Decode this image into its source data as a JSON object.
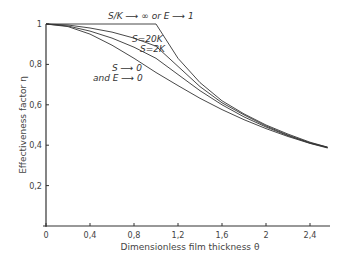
{
  "chart_data": {
    "type": "line",
    "title": "",
    "xlabel": "Dimensionless film thickness θ",
    "ylabel": "Effectiveness factor η",
    "xlim": [
      0,
      2.6
    ],
    "ylim": [
      0,
      1
    ],
    "x_ticks": [
      "0",
      "0,4",
      "0,8",
      "1,2",
      "1,6",
      "2",
      "2,4"
    ],
    "x_tick_values": [
      0,
      0.4,
      0.8,
      1.2,
      1.6,
      2.0,
      2.4
    ],
    "y_ticks": [
      "0,2",
      "0,4",
      "0,6",
      "0,8",
      "1"
    ],
    "y_tick_values": [
      0.2,
      0.4,
      0.6,
      0.8,
      1.0
    ],
    "grid": false,
    "legend": "inline annotations",
    "x": [
      0,
      0.2,
      0.4,
      0.6,
      0.8,
      1.0,
      1.2,
      1.4,
      1.6,
      1.8,
      2.0,
      2.2,
      2.4,
      2.56
    ],
    "series": [
      {
        "name": "S/K → ∞ or E → 1",
        "values": [
          1.0,
          1.0,
          1.0,
          1.0,
          1.0,
          1.0,
          0.83,
          0.71,
          0.62,
          0.555,
          0.5,
          0.455,
          0.415,
          0.39
        ]
      },
      {
        "name": "S = 20 K",
        "values": [
          1.0,
          0.995,
          0.98,
          0.96,
          0.93,
          0.89,
          0.79,
          0.69,
          0.61,
          0.55,
          0.495,
          0.45,
          0.412,
          0.39
        ]
      },
      {
        "name": "S = 2 K",
        "values": [
          1.0,
          0.99,
          0.965,
          0.93,
          0.885,
          0.83,
          0.75,
          0.67,
          0.6,
          0.54,
          0.49,
          0.447,
          0.41,
          0.388
        ]
      },
      {
        "name": "S → 0 and E → 0",
        "values": [
          1.0,
          0.987,
          0.95,
          0.895,
          0.83,
          0.76,
          0.695,
          0.632,
          0.576,
          0.526,
          0.482,
          0.443,
          0.409,
          0.386
        ]
      }
    ],
    "annotations": [
      {
        "text": "S/K → ∞ or E → 1",
        "x": 0.9,
        "y": 1.03
      },
      {
        "text": "S=20K",
        "x": 0.9,
        "y": 0.95
      },
      {
        "text": "S=2K",
        "x": 0.92,
        "y": 0.9
      },
      {
        "text": "S → 0",
        "x": 0.65,
        "y": 0.81
      },
      {
        "text": "and E → 0",
        "x": 0.6,
        "y": 0.77
      }
    ]
  },
  "labels": {
    "xlabel": "Dimensionless film thickness θ",
    "ylabel": "Effectiveness factor η",
    "ann_top": "S/K ⟶ ∞ or E ⟶ 1",
    "ann_s20": "S=20K",
    "ann_s2": "S=2K",
    "ann_s0": "S ⟶ 0",
    "ann_e0": "and E ⟶ 0"
  }
}
